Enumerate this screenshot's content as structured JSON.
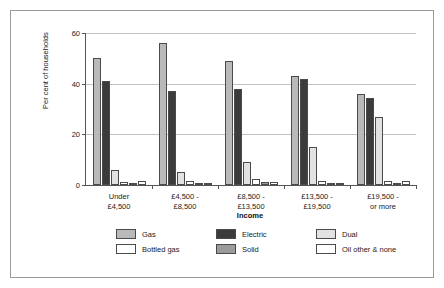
{
  "chart_data": {
    "type": "bar",
    "title": "",
    "xlabel": "Income",
    "ylabel": "Per cent of households",
    "ylim": [
      0,
      60
    ],
    "yticks": [
      0,
      20,
      40,
      60
    ],
    "grid": true,
    "legend_position": "bottom",
    "categories": [
      "Under\n£4,500",
      "£4,500 -\n£8,500",
      "£8,500 -\n£13,500",
      "£13,500 -\n£19,500",
      "£19,500 -\nor more"
    ],
    "category_lines": [
      [
        "Under",
        "£4,500"
      ],
      [
        "£4,500 -",
        "£8,500"
      ],
      [
        "£8,500 -",
        "£13,500"
      ],
      [
        "£13,500 -",
        "£19,500"
      ],
      [
        "£19,500 -",
        "or more"
      ]
    ],
    "series": [
      {
        "name": "Gas",
        "color": "#b9b9b9",
        "values": [
          50,
          56,
          49,
          43,
          36
        ]
      },
      {
        "name": "Electric",
        "color": "#3b3b3b",
        "values": [
          41,
          37,
          38,
          42,
          34.5
        ]
      },
      {
        "name": "Dual",
        "color": "#e2e2e2",
        "values": [
          6,
          5,
          9,
          15,
          27
        ]
      },
      {
        "name": "Bottled gas",
        "color": "#ffffff",
        "values": [
          1,
          1.5,
          2.5,
          1.7,
          1.5
        ]
      },
      {
        "name": "Solid",
        "color": "#9b9b9b",
        "values": [
          0.4,
          0.4,
          1,
          0.5,
          0.9
        ]
      },
      {
        "name": "Oil other & none",
        "color": "#ffffff",
        "values": [
          1.5,
          0.9,
          1.3,
          0.8,
          1.7
        ]
      }
    ]
  },
  "legend": {
    "rows": [
      [
        {
          "label": "Gas",
          "swatch": "#b9b9b9"
        },
        {
          "label": "Electric",
          "swatch": "#3b3b3b"
        },
        {
          "label": "Dual",
          "swatch": "#e2e2e2"
        }
      ],
      [
        {
          "label": "Bottled gas",
          "swatch": "#ffffff"
        },
        {
          "label": "Solid",
          "swatch": "#9b9b9b"
        },
        {
          "label": "Oil other & none",
          "swatch": "#ffffff"
        }
      ]
    ]
  }
}
